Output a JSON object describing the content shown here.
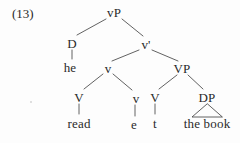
{
  "colors": {
    "background": "#fdfdfd",
    "text": "#2a2a2a",
    "line": "#3a3a3a"
  },
  "example": {
    "number": "(13)"
  },
  "tree": {
    "nodes": {
      "root": "vP",
      "spec_d": "D",
      "spec_d_child": "he",
      "v_bar": "v'",
      "v_head": "v",
      "v_head_left": "V",
      "v_head_left_child": "read",
      "v_head_right": "v",
      "v_head_right_child": "e",
      "vp": "VP",
      "vp_left": "V",
      "vp_left_child": "t",
      "dp": "DP",
      "dp_child": "the book"
    },
    "edges": [
      "vP-D",
      "vP-v'",
      "D-he",
      "v'-v",
      "v'-VP",
      "v-V",
      "v-v",
      "V-read",
      "v-e",
      "VP-V",
      "VP-DP",
      "V-t",
      "DP-the book (triangle)"
    ]
  }
}
